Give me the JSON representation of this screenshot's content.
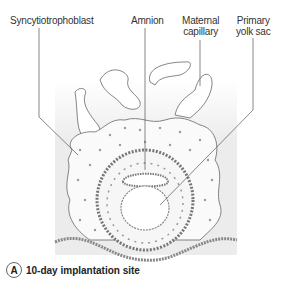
{
  "labels": {
    "syncytiotrophoblast": "Syncytiotrophoblast",
    "amnion": "Amnion",
    "maternal_capillary_1": "Maternal",
    "maternal_capillary_2": "capillary",
    "primary_yolk_sac_1": "Primary",
    "primary_yolk_sac_2": "yolk sac"
  },
  "caption": {
    "letter": "A",
    "text": "10-day implantation site"
  },
  "colors": {
    "background_tint": "#eeeeee",
    "line": "#555555",
    "cell": "#888888"
  }
}
